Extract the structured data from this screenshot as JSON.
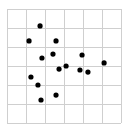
{
  "chart_data": {
    "type": "scatter",
    "title": "",
    "xlabel": "",
    "ylabel": "",
    "xlim": [
      0,
      6
    ],
    "ylim": [
      0,
      6
    ],
    "grid": true,
    "legend": null,
    "series": [
      {
        "name": "points",
        "color": "#000000",
        "points": [
          {
            "x": 1.74,
            "y": 5.11
          },
          {
            "x": 1.16,
            "y": 4.32
          },
          {
            "x": 2.58,
            "y": 4.32
          },
          {
            "x": 1.84,
            "y": 3.42
          },
          {
            "x": 2.42,
            "y": 3.63
          },
          {
            "x": 2.74,
            "y": 2.84
          },
          {
            "x": 3.11,
            "y": 3.0
          },
          {
            "x": 3.95,
            "y": 3.58
          },
          {
            "x": 3.84,
            "y": 2.79
          },
          {
            "x": 4.26,
            "y": 2.68
          },
          {
            "x": 5.11,
            "y": 3.16
          },
          {
            "x": 1.26,
            "y": 2.42
          },
          {
            "x": 1.63,
            "y": 2.0
          },
          {
            "x": 1.79,
            "y": 1.21
          },
          {
            "x": 2.58,
            "y": 1.47
          }
        ]
      }
    ]
  },
  "style": {
    "grid_color": "#cfcfcf",
    "dot_color": "#000000",
    "background": "#ffffff"
  }
}
